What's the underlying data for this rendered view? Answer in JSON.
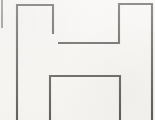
{
  "figure": {
    "title": "Block letter H outline",
    "style": "line drawing",
    "background_color": "#f7f5f2",
    "stroke_color": "#5e5d5b",
    "faint_stroke_color": "#8d8b88",
    "stroke_width": 2.1,
    "canvas": {
      "width": 155,
      "height": 120
    },
    "paths": {
      "left_leg_top": "M17,108 L17,5 L53,5 L53,34",
      "upper_crossbar": "M58,43 L119,43 L119,4 L152,4 L152,108",
      "right_leg_outer_bottom": "M152,108 L152,120",
      "lower_crossbar": "M50,120 L50,76 L120,76 L120,120",
      "left_leg_outer_bottom": "M17,108 L17,120",
      "edge_stub": "M2,0 L2,28"
    },
    "segments": [
      {
        "name": "left-leg-top-and-outer-edge",
        "description": "outer left vertical of the left leg plus its top horizontal and inner upper vertical"
      },
      {
        "name": "upper-crossbar",
        "description": "inner horizontal of the upper gap joining into the right leg inner vertical and right leg top"
      },
      {
        "name": "right-leg-outer-edge",
        "description": "outer right vertical running to the bottom of the frame"
      },
      {
        "name": "lower-crossbar",
        "description": "inner horizontal of the lower gap with verticals running off the bottom edge"
      },
      {
        "name": "left-edge-stub",
        "description": "short faint vertical mark at the far left edge of the frame"
      }
    ]
  }
}
